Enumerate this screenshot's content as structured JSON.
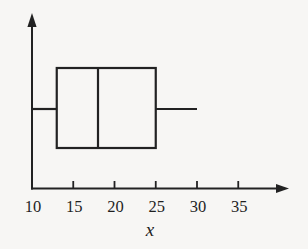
{
  "figure": {
    "background_color": "#f7f6f4",
    "line_color": "#222222"
  },
  "chart_data": {
    "type": "boxplot",
    "orientation": "horizontal",
    "title": "",
    "xlabel": "x",
    "ylabel": "",
    "xlim": [
      10,
      40
    ],
    "grid": false,
    "legend": false,
    "axis_ticks": [
      {
        "value": 10,
        "label": "10",
        "has_mark": false
      },
      {
        "value": 15,
        "label": "15",
        "has_mark": true
      },
      {
        "value": 20,
        "label": "20",
        "has_mark": true
      },
      {
        "value": 25,
        "label": "25",
        "has_mark": true
      },
      {
        "value": 30,
        "label": "30",
        "has_mark": true
      },
      {
        "value": 35,
        "label": "35",
        "has_mark": true
      }
    ],
    "series": [
      {
        "name": "x",
        "min": 10,
        "q1": 13,
        "median": 18,
        "q3": 25,
        "max": 30
      }
    ]
  }
}
